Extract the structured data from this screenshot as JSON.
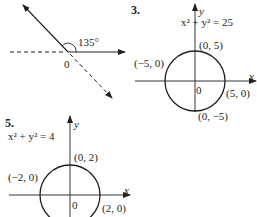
{
  "figure_1": {
    "angle_label": "135°",
    "origin_label": "0"
  },
  "figure_3": {
    "number": "3.",
    "equation": "x² + y² = 25",
    "axis_x": "x",
    "axis_y": "y",
    "origin_label": "0",
    "points": {
      "top": "(0, 5)",
      "left": "(−5, 0)",
      "right": "(5, 0)",
      "bottom": "(0, −5)"
    }
  },
  "figure_5": {
    "number": "5.",
    "equation": "x² + y² = 4",
    "axis_x": "x",
    "axis_y": "y",
    "origin_label": "0",
    "points": {
      "top": "(0, 2)",
      "left": "(−2, 0)",
      "right": "(2, 0)"
    }
  },
  "colors": {
    "ink": "#231f20",
    "background": "#ffffff"
  }
}
